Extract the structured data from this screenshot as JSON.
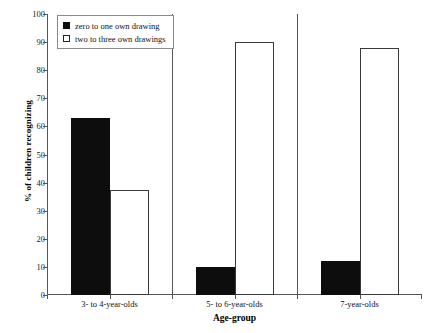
{
  "chart_data": {
    "type": "bar",
    "title": "",
    "xlabel": "Age-group",
    "ylabel": "% of children recognizing",
    "categories": [
      "3- to 4-year-olds",
      "5- to 6-year-olds",
      "7-year-olds"
    ],
    "series": [
      {
        "name": "zero to one own drawing",
        "color": "#0d0d0d",
        "fill": "solid",
        "values": [
          63,
          10,
          12
        ]
      },
      {
        "name": "two to three own drawings",
        "color": "#ffffff",
        "fill": "hollow",
        "values": [
          37.5,
          90,
          88
        ]
      }
    ],
    "ylim": [
      0,
      100
    ],
    "ytick_step": 10,
    "yticks": [
      "100",
      "90",
      "80",
      "70",
      "60",
      "50",
      "40",
      "30",
      "20",
      "10",
      "0"
    ],
    "grid": false,
    "legend_position": "top-left"
  }
}
